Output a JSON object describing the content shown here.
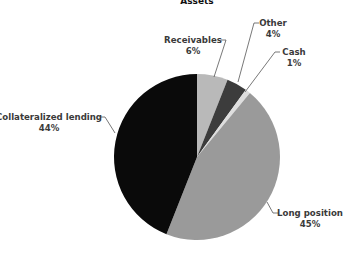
{
  "chart_data": {
    "type": "pie",
    "title": "Assets",
    "categories": [
      "Receivables",
      "Other",
      "Cash",
      "Long position",
      "Collateralized lending"
    ],
    "values": [
      6,
      4,
      1,
      45,
      44
    ],
    "unit": "%",
    "start_angle": "12 o'clock, clockwise",
    "colors": [
      "#b9b9b9",
      "#3c3c3c",
      "#dedede",
      "#9a9a9a",
      "#0a0a0a"
    ],
    "labels": [
      {
        "name": "Receivables",
        "value": "6%"
      },
      {
        "name": "Other",
        "value": "4%"
      },
      {
        "name": "Cash",
        "value": "1%"
      },
      {
        "name": "Long position",
        "value": "45%"
      },
      {
        "name": "Collateralized lending",
        "value": "44%"
      }
    ],
    "legend": "none (direct labels with leader lines)"
  }
}
